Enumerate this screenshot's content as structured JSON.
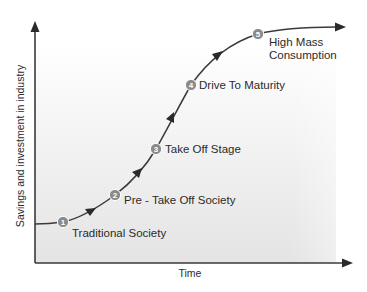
{
  "diagram": {
    "x_axis_label": "Time",
    "y_axis_label": "Savings and investment in industry",
    "colors": {
      "line": "#3a3a3a",
      "circle": "#8a8a8a",
      "circle_stroke": "#ffffff",
      "panel_top": "#ffffff",
      "panel_bottom": "#e4e4e4",
      "text": "#2b2b2b"
    },
    "stages": [
      {
        "number": "1",
        "label": "Traditional Society"
      },
      {
        "number": "2",
        "label": "Pre - Take Off Society"
      },
      {
        "number": "3",
        "label": "Take Off Stage"
      },
      {
        "number": "4",
        "label": "Drive To Maturity"
      },
      {
        "number": "5",
        "label_line1": "High Mass",
        "label_line2": "Consumption"
      }
    ]
  }
}
